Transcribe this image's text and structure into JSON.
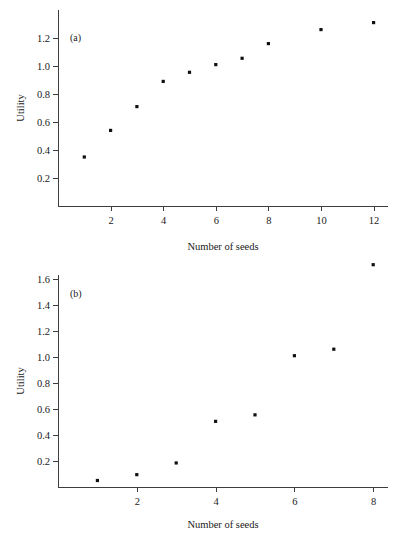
{
  "figure": {
    "background_color": "#ffffff",
    "marker_color": "#111111",
    "axis_color": "#3d3d3d"
  },
  "chart_data": [
    {
      "type": "scatter",
      "panel_label": "(a)",
      "title": "",
      "xlabel": "Number of seeds",
      "ylabel": "Utility",
      "x": [
        1,
        2,
        3,
        4,
        5,
        6,
        7,
        8,
        10,
        12
      ],
      "values": [
        0.35,
        0.54,
        0.71,
        0.89,
        0.955,
        1.01,
        1.055,
        1.16,
        1.26,
        1.31
      ],
      "xticks": [
        2,
        4,
        6,
        8,
        10,
        12
      ],
      "xtick_labels": [
        "2",
        "4",
        "6",
        "8",
        "10",
        "12"
      ],
      "yticks": [
        0.2,
        0.4,
        0.6,
        0.8,
        1.0,
        1.2
      ],
      "ytick_labels": [
        "0.2",
        "0.4",
        "0.6",
        "0.8",
        "1.0",
        "1.2"
      ],
      "xlim": [
        0,
        12.9
      ],
      "ylim": [
        0,
        1.36
      ],
      "grid": false,
      "legend": "none"
    },
    {
      "type": "scatter",
      "panel_label": "(b)",
      "title": "",
      "xlabel": "Number of seeds",
      "ylabel": "Utility",
      "x": [
        1,
        2,
        3,
        4,
        5,
        6,
        7,
        8
      ],
      "values": [
        0.05,
        0.095,
        0.185,
        0.505,
        0.555,
        1.01,
        1.06,
        1.71
      ],
      "xticks": [
        2,
        4,
        6,
        8
      ],
      "xtick_labels": [
        "2",
        "4",
        "6",
        "8"
      ],
      "yticks": [
        0.2,
        0.4,
        0.6,
        0.8,
        1.0,
        1.2,
        1.4,
        1.6
      ],
      "ytick_labels": [
        "0.2",
        "0.4",
        "0.6",
        "0.8",
        "1.0",
        "1.2",
        "1.4",
        "1.6"
      ],
      "xlim": [
        0,
        8.6
      ],
      "ylim": [
        0,
        1.79
      ],
      "grid": false,
      "legend": "none"
    }
  ]
}
